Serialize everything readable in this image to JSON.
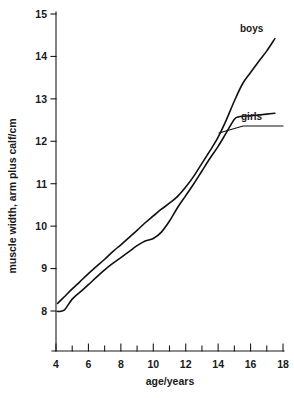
{
  "chart_data": {
    "type": "line",
    "title": "",
    "xlabel": "age/years",
    "ylabel": "muscle width, arm plus calf/cm",
    "xlim": [
      4,
      18
    ],
    "ylim": [
      8,
      15
    ],
    "grid": false,
    "legend_position": "inline-end-labels",
    "x_ticks_major": [
      4,
      6,
      8,
      10,
      12,
      14,
      16,
      18
    ],
    "x_ticks_minor": [
      5,
      7,
      9,
      11,
      13,
      15,
      17
    ],
    "y_ticks_major": [
      8,
      9,
      10,
      11,
      12,
      13,
      14,
      15
    ],
    "x_tick_labels": [
      "4",
      "6",
      "8",
      "10",
      "12",
      "14",
      "16",
      "18"
    ],
    "y_tick_labels": [
      "8",
      "9",
      "10",
      "11",
      "12",
      "13",
      "14",
      "15"
    ],
    "series": [
      {
        "name": "boys",
        "label": "boys",
        "color": "#111111",
        "x": [
          4.1,
          4.5,
          5.0,
          5.5,
          6.0,
          6.5,
          7.0,
          7.5,
          8.0,
          8.5,
          9.0,
          9.5,
          10.0,
          10.5,
          11.0,
          11.5,
          12.0,
          12.5,
          13.0,
          13.5,
          14.0,
          14.5,
          15.0,
          15.5,
          16.0,
          16.5,
          17.0,
          17.5
        ],
        "y": [
          8.18,
          8.33,
          8.52,
          8.7,
          8.88,
          9.05,
          9.22,
          9.4,
          9.56,
          9.73,
          9.9,
          10.08,
          10.24,
          10.4,
          10.54,
          10.7,
          10.92,
          11.18,
          11.48,
          11.78,
          12.1,
          12.5,
          12.95,
          13.35,
          13.62,
          13.88,
          14.13,
          14.42
        ]
      },
      {
        "name": "girls",
        "label": "girls",
        "color": "#111111",
        "x": [
          4.1,
          4.5,
          5.0,
          5.5,
          6.0,
          6.5,
          7.0,
          7.5,
          8.0,
          8.5,
          9.0,
          9.5,
          10.0,
          10.5,
          11.0,
          11.5,
          12.0,
          12.5,
          13.0,
          13.5,
          14.0,
          14.5,
          15.0,
          15.3,
          16.0,
          16.5,
          17.0,
          17.5
        ],
        "y": [
          7.99,
          8.02,
          8.28,
          8.45,
          8.62,
          8.8,
          8.97,
          9.12,
          9.26,
          9.4,
          9.54,
          9.65,
          9.71,
          9.86,
          10.12,
          10.44,
          10.72,
          11.0,
          11.3,
          11.6,
          11.88,
          12.2,
          12.52,
          12.58,
          12.6,
          12.62,
          12.64,
          12.66
        ]
      }
    ],
    "annotations": [
      {
        "name": "boys-label",
        "text": "boys",
        "x": 16.5,
        "y": 14.85
      },
      {
        "name": "girls-label",
        "text": "girls",
        "x": 16.3,
        "y": 12.95
      }
    ]
  }
}
